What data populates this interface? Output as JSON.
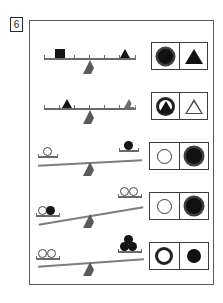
{
  "problem": {
    "number": "6",
    "type": "balance-scale-puzzle",
    "panel_border_color": "#5b5b5b"
  },
  "colors": {
    "ink": "#141414",
    "beam": "#6a6a6a",
    "plank": "#7d7d7d",
    "frame": "#3c3c3c",
    "outline": "#4a4a4a",
    "paper": "#ffffff"
  },
  "rows": [
    {
      "id": "row-1",
      "beam_style": "ruler",
      "tilt": "level",
      "ticks": 7,
      "left_objects": [
        {
          "shape": "square",
          "fill": "filled",
          "tick": 2
        }
      ],
      "right_objects": [
        {
          "shape": "triangle",
          "fill": "filled",
          "tick": 6
        }
      ],
      "answer": {
        "left_cell": {
          "shape": "circle",
          "fill": "filled",
          "style": "ring"
        },
        "right_cell": {
          "shape": "triangle",
          "fill": "filled",
          "style": "plain"
        }
      }
    },
    {
      "id": "row-2",
      "beam_style": "ruler",
      "tilt": "level",
      "ticks": 7,
      "left_objects": [
        {
          "shape": "triangle",
          "fill": "filled",
          "tick": 2
        }
      ],
      "right_objects": [
        {
          "shape": "triangle",
          "fill": "outline",
          "tick": 6
        }
      ],
      "answer": {
        "left_cell": {
          "shape": "circle",
          "fill": "outline",
          "style": "ring-with-triangle"
        },
        "right_cell": {
          "shape": "triangle",
          "fill": "outline",
          "style": "plain"
        }
      }
    },
    {
      "id": "row-3",
      "beam_style": "plank",
      "tilt": "left-down",
      "tilt_degrees": 3,
      "left_objects": [
        {
          "shape": "circle",
          "fill": "outline"
        }
      ],
      "right_objects": [
        {
          "shape": "circle",
          "fill": "filled"
        }
      ],
      "answer": {
        "left_cell": {
          "shape": "circle",
          "fill": "outline",
          "style": "plain"
        },
        "right_cell": {
          "shape": "circle",
          "fill": "filled",
          "style": "ring"
        }
      }
    },
    {
      "id": "row-4",
      "beam_style": "plank",
      "tilt": "left-down",
      "tilt_degrees": 10,
      "left_objects": [
        {
          "shape": "circle",
          "fill": "outline"
        },
        {
          "shape": "circle",
          "fill": "filled"
        }
      ],
      "right_objects": [
        {
          "shape": "circle",
          "fill": "outline"
        },
        {
          "shape": "circle",
          "fill": "outline"
        }
      ],
      "answer": {
        "left_cell": {
          "shape": "circle",
          "fill": "outline",
          "style": "plain"
        },
        "right_cell": {
          "shape": "circle",
          "fill": "filled",
          "style": "ring"
        }
      }
    },
    {
      "id": "row-5",
      "beam_style": "plank",
      "tilt": "left-down",
      "tilt_degrees": 4,
      "left_objects": [
        {
          "shape": "circle",
          "fill": "outline"
        },
        {
          "shape": "circle",
          "fill": "outline"
        }
      ],
      "right_objects": [
        {
          "shape": "circle",
          "fill": "filled"
        },
        {
          "shape": "circle",
          "fill": "filled"
        },
        {
          "shape": "circle",
          "fill": "filled"
        }
      ],
      "answer": {
        "left_cell": {
          "shape": "circle",
          "fill": "outline",
          "style": "thick-ring"
        },
        "right_cell": {
          "shape": "circle",
          "fill": "filled",
          "style": "plain"
        }
      }
    }
  ]
}
